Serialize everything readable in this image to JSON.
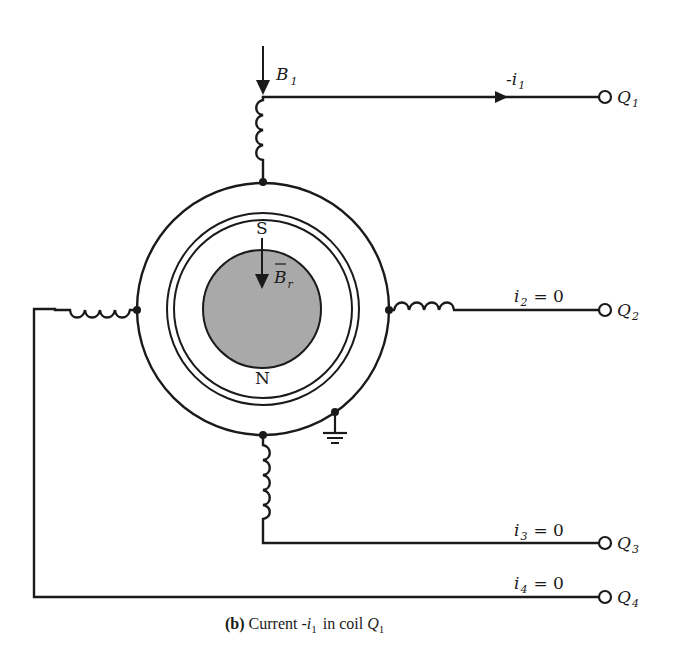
{
  "figure": {
    "caption": {
      "prefix": "(b)",
      "text": "Current -",
      "var": "i",
      "var_sub": "1",
      "middle": "in coil",
      "coil": "Q",
      "coil_sub": "1"
    },
    "field_labels": {
      "b1": {
        "base": "B",
        "sub": "1"
      },
      "br": {
        "base": "B",
        "sub": "r",
        "overbar": true
      }
    },
    "poles": {
      "south": "S",
      "north": "N"
    },
    "terminals": [
      {
        "id": "Q1",
        "base": "Q",
        "sub": "1",
        "current_label": "-i",
        "current_sub": "1",
        "current_value": ""
      },
      {
        "id": "Q2",
        "base": "Q",
        "sub": "2",
        "current_label": "i",
        "current_sub": "2",
        "current_value": "= 0"
      },
      {
        "id": "Q3",
        "base": "Q",
        "sub": "3",
        "current_label": "i",
        "current_sub": "3",
        "current_value": "= 0"
      },
      {
        "id": "Q4",
        "base": "Q",
        "sub": "4",
        "current_label": "i",
        "current_sub": "4",
        "current_value": "= 0"
      }
    ],
    "colors": {
      "line": "#1a1a1a",
      "rotor_fill": "#a9a9a9",
      "background": "#ffffff"
    }
  }
}
